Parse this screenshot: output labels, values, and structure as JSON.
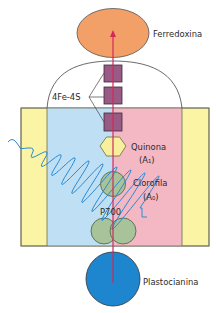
{
  "diagram": {
    "colors": {
      "ferredoxin": "#f2a068",
      "membrane_outer": "#fbf4a4",
      "membrane_left": "#bfe0f4",
      "membrane_right": "#f4b8c4",
      "iron_sulfur": "#9a5a86",
      "quinone": "#f8ef9c",
      "chlorophyll": "#a8c39a",
      "plastocyanin": "#1d86cf",
      "electron_path": "#d2285a",
      "light_wave": "#2a8ad4",
      "outline": "#4a4a4a"
    },
    "labels": {
      "ferredoxin": "Ferredoxina",
      "iron_sulfur": "4Fe-4S",
      "quinone": "Quinona",
      "quinone_sub": "(A₁)",
      "chlorophyll": "Clorofila",
      "chlorophyll_sub": "(A₀)",
      "p700": "P700",
      "plastocyanin": "Plastocianina"
    }
  }
}
